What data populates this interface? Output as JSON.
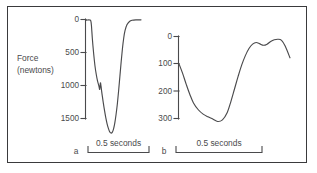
{
  "figure": {
    "background_color": "#ffffff",
    "frame_color": "#3a3a3c",
    "ink_color": "#4a4a4c",
    "axis_title_line1": "Force",
    "axis_title_line2": "(newtons)"
  },
  "panels": {
    "a": {
      "letter": "a",
      "scale_label": "0.5 seconds",
      "tick_labels": [
        "0",
        "500",
        "1000",
        "1500"
      ]
    },
    "b": {
      "letter": "b",
      "scale_label": "0.5 seconds",
      "tick_labels": [
        "0",
        "100",
        "200",
        "300"
      ]
    }
  },
  "chart_data": {
    "type": "line",
    "title": "",
    "subtitle": "",
    "xlabel": "",
    "ylabel": "Force (newtons)",
    "grid": false,
    "legend": "none",
    "note": "Two force-vs-time recordings plotted with an inverted y-axis (force increases downward). Each panel has a 0.5 second horizontal scale bar instead of a time axis.",
    "charts": [
      {
        "panel": "a",
        "letter": "a",
        "type": "line",
        "ylabel": "Force (newtons)",
        "yticks": [
          0,
          500,
          1000,
          1500
        ],
        "ylim": [
          0,
          1750
        ],
        "y_axis_inverted": true,
        "xlabel": "",
        "x_scale_bar": "0.5 seconds",
        "x_units": "seconds",
        "xlim": [
          0,
          0.86
        ],
        "series": [
          {
            "name": "force trace a",
            "x": [
              0.0,
              0.02,
              0.04,
              0.06,
              0.075,
              0.085,
              0.1,
              0.12,
              0.14,
              0.16,
              0.18,
              0.2,
              0.215,
              0.225,
              0.235,
              0.245,
              0.255,
              0.27,
              0.29,
              0.31,
              0.33,
              0.35,
              0.37,
              0.39,
              0.41,
              0.43,
              0.45,
              0.47,
              0.49,
              0.51,
              0.53,
              0.55,
              0.57,
              0.59,
              0.61,
              0.64,
              0.68,
              0.72,
              0.78,
              0.86
            ],
            "y": [
              10,
              8,
              6,
              8,
              20,
              90,
              300,
              520,
              700,
              830,
              930,
              1000,
              1060,
              960,
              1010,
              1090,
              1160,
              1260,
              1380,
              1490,
              1580,
              1650,
              1700,
              1720,
              1710,
              1660,
              1570,
              1440,
              1280,
              1080,
              860,
              640,
              440,
              280,
              170,
              80,
              30,
              12,
              6,
              5
            ]
          }
        ]
      },
      {
        "panel": "b",
        "letter": "b",
        "type": "line",
        "ylabel": "Force (newtons)",
        "yticks": [
          0,
          100,
          200,
          300
        ],
        "ylim": [
          0,
          330
        ],
        "y_axis_inverted": true,
        "xlabel": "",
        "x_scale_bar": "0.5 seconds",
        "x_units": "seconds",
        "xlim": [
          0,
          0.92
        ],
        "series": [
          {
            "name": "force trace b",
            "x": [
              0.0,
              0.03,
              0.06,
              0.09,
              0.12,
              0.16,
              0.2,
              0.24,
              0.28,
              0.32,
              0.36,
              0.4,
              0.43,
              0.46,
              0.49,
              0.52,
              0.55,
              0.58,
              0.61,
              0.64,
              0.67,
              0.7,
              0.73,
              0.76,
              0.79,
              0.82,
              0.85,
              0.88,
              0.92
            ],
            "y": [
              100,
              135,
              175,
              212,
              243,
              268,
              284,
              294,
              302,
              311,
              305,
              278,
              238,
              192,
              146,
              104,
              70,
              44,
              28,
              22,
              27,
              32,
              28,
              18,
              12,
              10,
              14,
              35,
              78
            ]
          }
        ]
      }
    ]
  }
}
